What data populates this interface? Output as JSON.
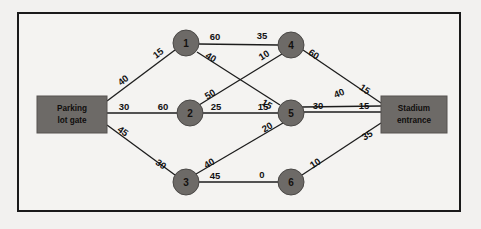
{
  "diagram": {
    "type": "network-flow-graph",
    "title": "",
    "frame": {
      "border_color": "#1a1a1a",
      "background": "#f4f3f1"
    },
    "colors": {
      "node_fill": "#6d6a67",
      "edge_stroke": "#1c1c1c",
      "terminal_fill": "#6d6a67",
      "page_background": "#f2f1ef",
      "label_text": "#111111"
    },
    "terminals": [
      {
        "id": "source",
        "name": "parking-lot-gate",
        "line1": "Parking",
        "line2": "lot gate",
        "x": 37,
        "y": 96,
        "w": 70,
        "h": 37
      },
      {
        "id": "sink",
        "name": "stadium-entrance",
        "line1": "Stadium",
        "line2": "entrance",
        "x": 381,
        "y": 96,
        "w": 66,
        "h": 37
      }
    ],
    "nodes": [
      {
        "id": "1",
        "label": "1",
        "cx": 186,
        "cy": 43,
        "r": 13
      },
      {
        "id": "4",
        "label": "4",
        "cx": 291,
        "cy": 45,
        "r": 13
      },
      {
        "id": "2",
        "label": "2",
        "cx": 190,
        "cy": 113,
        "r": 13
      },
      {
        "id": "5",
        "label": "5",
        "cx": 291,
        "cy": 113,
        "r": 13
      },
      {
        "id": "3",
        "label": "3",
        "cx": 186,
        "cy": 182,
        "r": 13
      },
      {
        "id": "6",
        "label": "6",
        "cx": 291,
        "cy": 182,
        "r": 13
      }
    ],
    "edges": [
      {
        "id": "e-source-1",
        "from": "source",
        "to": "1",
        "x1": 107,
        "y1": 101,
        "x2": 175,
        "y2": 50,
        "weights": [
          {
            "value": "40",
            "x": 123,
            "y": 80,
            "rotate": -37
          },
          {
            "value": "15",
            "x": 158,
            "y": 53,
            "rotate": -37
          }
        ]
      },
      {
        "id": "e-source-2",
        "from": "source",
        "to": "2",
        "x1": 107,
        "y1": 113,
        "x2": 177,
        "y2": 113,
        "weights": [
          {
            "value": "30",
            "x": 124,
            "y": 106,
            "rotate": 0
          },
          {
            "value": "60",
            "x": 163,
            "y": 106,
            "rotate": 0
          }
        ]
      },
      {
        "id": "e-source-3",
        "from": "source",
        "to": "3",
        "x1": 107,
        "y1": 125,
        "x2": 175,
        "y2": 175,
        "weights": [
          {
            "value": "45",
            "x": 123,
            "y": 131,
            "rotate": 36
          },
          {
            "value": "30",
            "x": 161,
            "y": 164,
            "rotate": 36
          }
        ]
      },
      {
        "id": "e-1-4",
        "from": "1",
        "to": "4",
        "x1": 199,
        "y1": 44,
        "x2": 278,
        "y2": 45,
        "weights": [
          {
            "value": "60",
            "x": 215,
            "y": 36,
            "rotate": 0
          },
          {
            "value": "35",
            "x": 262,
            "y": 35,
            "rotate": 0
          }
        ]
      },
      {
        "id": "e-1-5",
        "from": "1",
        "to": "5",
        "x1": 197,
        "y1": 52,
        "x2": 280,
        "y2": 105,
        "weights": [
          {
            "value": "40",
            "x": 211,
            "y": 57,
            "rotate": 31
          },
          {
            "value": "15",
            "x": 267,
            "y": 104,
            "rotate": 31
          }
        ]
      },
      {
        "id": "e-2-4",
        "from": "2",
        "to": "4",
        "x1": 199,
        "y1": 105,
        "x2": 282,
        "y2": 54,
        "weights": [
          {
            "value": "50",
            "x": 210,
            "y": 94,
            "rotate": -32
          },
          {
            "value": "10",
            "x": 264,
            "y": 55,
            "rotate": -32
          }
        ]
      },
      {
        "id": "e-2-5",
        "from": "2",
        "to": "5",
        "x1": 203,
        "y1": 113,
        "x2": 278,
        "y2": 113,
        "weights": [
          {
            "value": "25",
            "x": 216,
            "y": 106,
            "rotate": 0
          },
          {
            "value": "15",
            "x": 263,
            "y": 106,
            "rotate": 0
          }
        ]
      },
      {
        "id": "e-3-5",
        "from": "3",
        "to": "5",
        "x1": 196,
        "y1": 174,
        "x2": 283,
        "y2": 123,
        "weights": [
          {
            "value": "40",
            "x": 209,
            "y": 163,
            "rotate": -30
          },
          {
            "value": "20",
            "x": 267,
            "y": 127,
            "rotate": -30
          }
        ]
      },
      {
        "id": "e-3-6",
        "from": "3",
        "to": "6",
        "x1": 199,
        "y1": 182,
        "x2": 278,
        "y2": 182,
        "weights": [
          {
            "value": "45",
            "x": 215,
            "y": 175,
            "rotate": 0
          },
          {
            "value": "0",
            "x": 262,
            "y": 174,
            "rotate": 0
          }
        ]
      },
      {
        "id": "e-4-sink",
        "from": "4",
        "to": "sink",
        "x1": 303,
        "y1": 50,
        "x2": 381,
        "y2": 103,
        "weights": [
          {
            "value": "60",
            "x": 314,
            "y": 54,
            "rotate": 33
          },
          {
            "value": "15",
            "x": 365,
            "y": 89,
            "rotate": 33
          }
        ]
      },
      {
        "id": "e-5-sink",
        "from": "5",
        "to": "sink",
        "x1": 304,
        "y1": 112,
        "x2": 381,
        "y2": 112,
        "weights": [
          {
            "value": "30",
            "x": 318,
            "y": 105,
            "rotate": 0
          },
          {
            "value": "15",
            "x": 364,
            "y": 105,
            "rotate": 0
          }
        ]
      },
      {
        "id": "e-5-sink-alt",
        "from": "5",
        "to": "sink",
        "x1": 302,
        "y1": 107,
        "x2": 381,
        "y2": 106,
        "weights": [
          {
            "value": "40",
            "x": 339,
            "y": 93,
            "rotate": -22
          }
        ]
      },
      {
        "id": "e-6-sink",
        "from": "6",
        "to": "sink",
        "x1": 302,
        "y1": 175,
        "x2": 381,
        "y2": 123,
        "weights": [
          {
            "value": "10",
            "x": 315,
            "y": 163,
            "rotate": -33
          },
          {
            "value": "35",
            "x": 367,
            "y": 135,
            "rotate": -33
          }
        ]
      }
    ]
  },
  "chart_data": {
    "type": "diagram",
    "source": "Parking lot gate",
    "sink": "Stadium entrance",
    "nodes": [
      "1",
      "2",
      "3",
      "4",
      "5",
      "6"
    ],
    "arcs": [
      {
        "from": "Parking lot gate",
        "to": "1",
        "labels": [
          "40",
          "15"
        ]
      },
      {
        "from": "Parking lot gate",
        "to": "2",
        "labels": [
          "30",
          "60"
        ]
      },
      {
        "from": "Parking lot gate",
        "to": "3",
        "labels": [
          "45",
          "30"
        ]
      },
      {
        "from": "1",
        "to": "4",
        "labels": [
          "60",
          "35"
        ]
      },
      {
        "from": "1",
        "to": "5",
        "labels": [
          "40",
          "15"
        ]
      },
      {
        "from": "2",
        "to": "4",
        "labels": [
          "50",
          "10"
        ]
      },
      {
        "from": "2",
        "to": "5",
        "labels": [
          "25",
          "15"
        ]
      },
      {
        "from": "3",
        "to": "5",
        "labels": [
          "40",
          "20"
        ]
      },
      {
        "from": "3",
        "to": "6",
        "labels": [
          "45",
          "0"
        ]
      },
      {
        "from": "4",
        "to": "Stadium entrance",
        "labels": [
          "60",
          "15"
        ]
      },
      {
        "from": "5",
        "to": "Stadium entrance",
        "labels": [
          "30",
          "15"
        ]
      },
      {
        "from": "4",
        "to": "Stadium entrance (lower)",
        "labels": [
          "40"
        ]
      },
      {
        "from": "6",
        "to": "Stadium entrance",
        "labels": [
          "10",
          "35"
        ]
      }
    ]
  }
}
